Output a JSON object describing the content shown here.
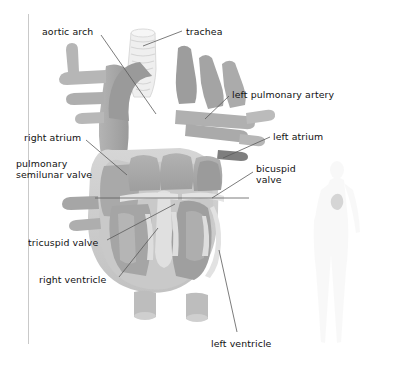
{
  "page": {
    "running_head": "BLOOD VESSELS, AND HEART",
    "figure_title": "heart-cross-section-diagram"
  },
  "colors": {
    "background": "#ffffff",
    "rule": "#c9c9c9",
    "running_head_text": "#b9b9b9",
    "label_text": "#111111",
    "leader_line": "#5a5a5a",
    "vessel_dark": "#9d9d9d",
    "vessel_mid": "#b0b0b0",
    "vessel_light": "#c6c6c6",
    "chamber_fill": "#a8a8a8",
    "septum_light": "#dcdcdc",
    "muscle_wall": "#cfcfcf",
    "trachea": "#ededed",
    "body_silhouette": "#f2f2f2",
    "body_heart_marker": "#b4b4b4"
  },
  "labels": [
    {
      "id": "aortic-arch",
      "text": "aortic arch",
      "x": 42,
      "y": 26,
      "align": "left"
    },
    {
      "id": "trachea",
      "text": "trachea",
      "x": 186,
      "y": 26,
      "align": "left"
    },
    {
      "id": "left-pulmonary-artery",
      "text": "left pulmonary artery",
      "x": 232,
      "y": 89,
      "align": "left"
    },
    {
      "id": "right-atrium",
      "text": "right atrium",
      "x": 24,
      "y": 132,
      "align": "left"
    },
    {
      "id": "left-atrium",
      "text": "left atrium",
      "x": 273,
      "y": 131,
      "align": "left"
    },
    {
      "id": "pulmonary-semilunar-valve",
      "text": "pulmonary\nsemilunar valve",
      "x": 16,
      "y": 158,
      "align": "left"
    },
    {
      "id": "bicuspid-valve",
      "text": "bicuspid\nvalve",
      "x": 256,
      "y": 163,
      "align": "left"
    },
    {
      "id": "tricuspid-valve",
      "text": "tricuspid valve",
      "x": 28,
      "y": 237,
      "align": "left"
    },
    {
      "id": "right-ventricle",
      "text": "right ventricle",
      "x": 39,
      "y": 274,
      "align": "left"
    },
    {
      "id": "left-ventricle",
      "text": "left ventricle",
      "x": 211,
      "y": 338,
      "align": "left"
    }
  ],
  "leader_lines": [
    {
      "id": "leader-aortic-arch",
      "points": "101,35 156,114"
    },
    {
      "id": "leader-trachea",
      "points": "182,31 143,46"
    },
    {
      "id": "leader-left-pulmonary-artery",
      "points": "229,96 205,119"
    },
    {
      "id": "leader-right-atrium",
      "points": "86,140 127,175"
    },
    {
      "id": "leader-left-atrium",
      "points": "270,137 223,158"
    },
    {
      "id": "leader-pulmonary-semilunar-valve",
      "points": "95,198 249,198"
    },
    {
      "id": "leader-bicuspid-valve",
      "points": "253,172 212,198"
    },
    {
      "id": "leader-tricuspid-valve",
      "points": "107,240 175,204"
    },
    {
      "id": "leader-right-ventricle",
      "points": "119,277 158,228"
    },
    {
      "id": "leader-left-ventricle",
      "points": "237,332 219,250"
    }
  ]
}
